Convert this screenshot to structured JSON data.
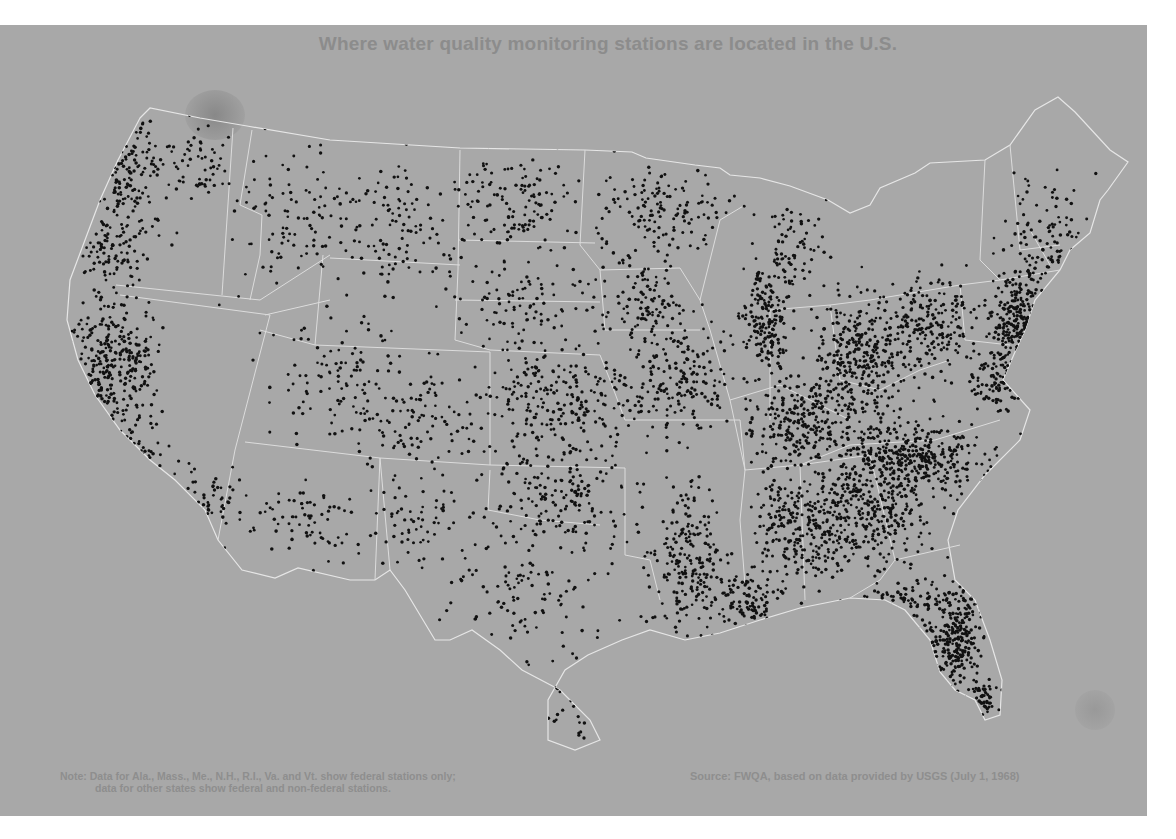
{
  "title": "Where water quality monitoring stations are located in the U.S.",
  "note": {
    "line1": "Note: Data for Ala., Mass., Me., N.H., R.I., Va. and Vt. show federal stations only;",
    "line2": "data for other states show federal and non-federal stations."
  },
  "source": "Source: FWQA, based on data provided by USGS (July 1, 1968)",
  "colors": {
    "background": "#a8a8a8",
    "border": "#e6e6e6",
    "dot": "#111111",
    "text": "#8c8c8c"
  },
  "map": {
    "legend_symbol": "dot = monitoring station",
    "outline": "M140,118 L150,108 L200,118 L247,126 L330,140 L460,148 L585,150 L632,152 L646,158 L695,165 L720,168 L730,175 L760,178 L790,186 L828,200 L850,213 L870,205 L880,188 L915,173 L930,163 L985,160 L1010,145 L1035,110 L1058,97 L1075,112 L1110,150 L1128,162 L1108,190 L1100,200 L1090,233 L1070,250 L1060,270 L1035,300 L1025,330 L1015,352 L1003,380 L1030,410 L1020,440 L985,475 L958,510 L948,540 L955,580 L975,600 L990,640 L1002,680 L1000,715 L985,720 L975,700 L955,690 L940,672 L930,640 L905,610 L885,600 L850,598 L800,608 L760,620 L720,633 L685,640 L650,630 L622,640 L588,655 L565,670 L548,700 L548,740 L575,750 L600,740 L590,720 L560,690 L522,670 L500,650 L472,630 L450,640 L435,640 L405,590 L390,570 L375,580 L350,580 L298,568 L275,578 L242,570 L218,540 L205,510 L175,480 L150,460 L120,430 L95,395 L78,360 L67,320 L70,280 L85,240 L100,200 L118,160 Z",
    "state_lines": [
      "M233,128 L222,295",
      "M252,130 L240,205 L262,215 L260,255 L250,300",
      "M116,285 L260,300 L330,255",
      "M120,295 L270,315",
      "M270,315 L235,450 L218,540",
      "M265,315 L330,300",
      "M330,258 L460,265",
      "M323,255 L315,345 L260,330",
      "M315,345 L490,352 L490,465",
      "M460,150 L458,270 L455,340 L490,350",
      "M458,240 L595,243",
      "M585,150 L580,245 L600,270 L605,330",
      "M455,300 L600,302",
      "M490,350 L600,355 L610,380 L625,420",
      "M490,465 L380,458 L375,580",
      "M245,442 L380,458",
      "M380,458 L390,570",
      "M490,465 L625,468",
      "M490,470 L488,510 L540,520 L600,525",
      "M600,270 L680,268 L700,300 L710,330",
      "M605,330 L700,330",
      "M625,420 L740,420 L745,470",
      "M625,468 L625,555 L650,560 L660,600",
      "M745,470 L740,520 L745,585",
      "M745,470 L800,465 L870,455",
      "M800,465 L805,600",
      "M800,465 L850,445 L935,440 L1000,420",
      "M870,455 L895,560 L880,580 L850,598",
      "M895,560 L960,545",
      "M710,330 L730,400 L745,470",
      "M730,400 L780,385 L810,400 L850,420",
      "M700,300 L720,220 L745,205",
      "M770,310 L770,420",
      "M770,310 L830,305 L870,300",
      "M830,305 L840,380 L880,390 L920,370 L950,360",
      "M870,300 L960,285 L1000,280",
      "M960,285 L965,340 L1010,345",
      "M985,160 L980,260 L1000,280",
      "M1010,145 L1020,250 L1060,245",
      "M1000,280 L1060,270",
      "M1030,230 L1050,265"
    ],
    "clusters": [
      {
        "cx": 125,
        "cy": 175,
        "rx": 40,
        "ry": 55,
        "n": 180
      },
      {
        "cx": 195,
        "cy": 165,
        "rx": 35,
        "ry": 40,
        "n": 60
      },
      {
        "cx": 105,
        "cy": 245,
        "rx": 30,
        "ry": 45,
        "n": 90
      },
      {
        "cx": 105,
        "cy": 360,
        "rx": 35,
        "ry": 55,
        "n": 240
      },
      {
        "cx": 140,
        "cy": 360,
        "rx": 20,
        "ry": 40,
        "n": 60
      },
      {
        "cx": 135,
        "cy": 460,
        "rx": 35,
        "ry": 50,
        "n": 120
      },
      {
        "cx": 210,
        "cy": 500,
        "rx": 25,
        "ry": 35,
        "n": 50
      },
      {
        "cx": 300,
        "cy": 210,
        "rx": 70,
        "ry": 70,
        "n": 110
      },
      {
        "cx": 400,
        "cy": 230,
        "rx": 60,
        "ry": 70,
        "n": 110
      },
      {
        "cx": 340,
        "cy": 380,
        "rx": 60,
        "ry": 60,
        "n": 110
      },
      {
        "cx": 420,
        "cy": 420,
        "rx": 60,
        "ry": 45,
        "n": 100
      },
      {
        "cx": 310,
        "cy": 520,
        "rx": 60,
        "ry": 45,
        "n": 80
      },
      {
        "cx": 430,
        "cy": 520,
        "rx": 40,
        "ry": 40,
        "n": 60
      },
      {
        "cx": 520,
        "cy": 200,
        "rx": 60,
        "ry": 50,
        "n": 130
      },
      {
        "cx": 660,
        "cy": 210,
        "rx": 55,
        "ry": 45,
        "n": 130
      },
      {
        "cx": 520,
        "cy": 300,
        "rx": 60,
        "ry": 45,
        "n": 100
      },
      {
        "cx": 650,
        "cy": 300,
        "rx": 45,
        "ry": 45,
        "n": 110
      },
      {
        "cx": 560,
        "cy": 400,
        "rx": 70,
        "ry": 50,
        "n": 230
      },
      {
        "cx": 680,
        "cy": 380,
        "rx": 50,
        "ry": 50,
        "n": 180
      },
      {
        "cx": 560,
        "cy": 500,
        "rx": 70,
        "ry": 50,
        "n": 180
      },
      {
        "cx": 520,
        "cy": 600,
        "rx": 60,
        "ry": 50,
        "n": 90
      },
      {
        "cx": 690,
        "cy": 560,
        "rx": 35,
        "ry": 70,
        "n": 220
      },
      {
        "cx": 745,
        "cy": 600,
        "rx": 30,
        "ry": 25,
        "n": 110
      },
      {
        "cx": 790,
        "cy": 530,
        "rx": 30,
        "ry": 60,
        "n": 190
      },
      {
        "cx": 840,
        "cy": 510,
        "rx": 35,
        "ry": 60,
        "n": 180
      },
      {
        "cx": 765,
        "cy": 320,
        "rx": 20,
        "ry": 40,
        "n": 170
      },
      {
        "cx": 790,
        "cy": 250,
        "rx": 35,
        "ry": 45,
        "n": 90
      },
      {
        "cx": 860,
        "cy": 360,
        "rx": 45,
        "ry": 50,
        "n": 330
      },
      {
        "cx": 800,
        "cy": 420,
        "rx": 45,
        "ry": 40,
        "n": 240
      },
      {
        "cx": 910,
        "cy": 460,
        "rx": 70,
        "ry": 35,
        "n": 420
      },
      {
        "cx": 880,
        "cy": 520,
        "rx": 45,
        "ry": 45,
        "n": 160
      },
      {
        "cx": 930,
        "cy": 320,
        "rx": 45,
        "ry": 40,
        "n": 200
      },
      {
        "cx": 1020,
        "cy": 320,
        "rx": 25,
        "ry": 40,
        "n": 260
      },
      {
        "cx": 1000,
        "cy": 380,
        "rx": 30,
        "ry": 30,
        "n": 120
      },
      {
        "cx": 1050,
        "cy": 240,
        "rx": 35,
        "ry": 60,
        "n": 120
      },
      {
        "cx": 955,
        "cy": 640,
        "rx": 25,
        "ry": 50,
        "n": 300
      },
      {
        "cx": 985,
        "cy": 700,
        "rx": 12,
        "ry": 20,
        "n": 50
      },
      {
        "cx": 900,
        "cy": 600,
        "rx": 40,
        "ry": 20,
        "n": 70
      },
      {
        "cx": 570,
        "cy": 700,
        "rx": 30,
        "ry": 40,
        "n": 40
      }
    ]
  }
}
